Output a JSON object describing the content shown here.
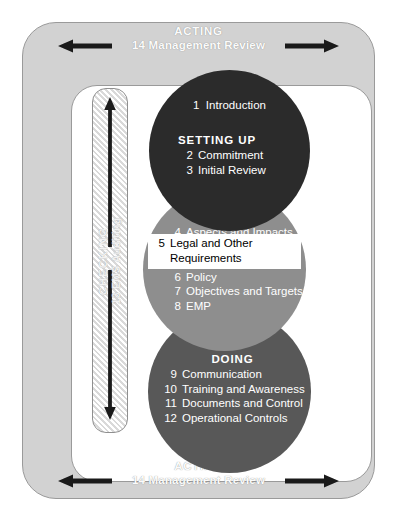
{
  "diagram": {
    "colors": {
      "frame_fill": "#d2d2d2",
      "frame_border": "#9a9a9a",
      "circle_setting_up": "#2b2b2b",
      "circle_planning": "#8e8e8e",
      "circle_doing": "#585858",
      "highlight_background": "#ffffff",
      "highlight_text": "#000000",
      "band_text": "#fbfbfb",
      "arrow": "#1a1a1a"
    }
  },
  "acting_band": {
    "title": "ACTING",
    "subtitle": "14  Management Review",
    "arrow_left_icon": "arrow-left-icon",
    "arrow_right_icon": "arrow-right-icon"
  },
  "checking_bar": {
    "title": "CHECKING",
    "subtitle": "13  EMS Auditing",
    "arrow_up_icon": "arrow-up-icon",
    "arrow_down_icon": "arrow-down-icon"
  },
  "setting_up": {
    "lead_item": {
      "num": "1",
      "label": "Introduction"
    },
    "title": "SETTING UP",
    "items": [
      {
        "num": "2",
        "label": "Commitment"
      },
      {
        "num": "3",
        "label": "Initial Review"
      }
    ]
  },
  "planning": {
    "title": "PLANNING",
    "items": [
      {
        "num": "4",
        "label": "Aspects and Impacts"
      },
      {
        "num": "6",
        "label": "Policy"
      },
      {
        "num": "7",
        "label": "Objectives and Targets"
      },
      {
        "num": "8",
        "label": "EMP"
      }
    ],
    "highlighted_item": {
      "num": "5",
      "label_line1": "Legal and Other",
      "label_line2": "Requirements"
    }
  },
  "doing": {
    "title": "DOING",
    "items": [
      {
        "num": "9",
        "label": "Communication"
      },
      {
        "num": "10",
        "label": "Training and Awareness"
      },
      {
        "num": "11",
        "label": "Documents and Control"
      },
      {
        "num": "12",
        "label": "Operational Controls"
      }
    ]
  }
}
